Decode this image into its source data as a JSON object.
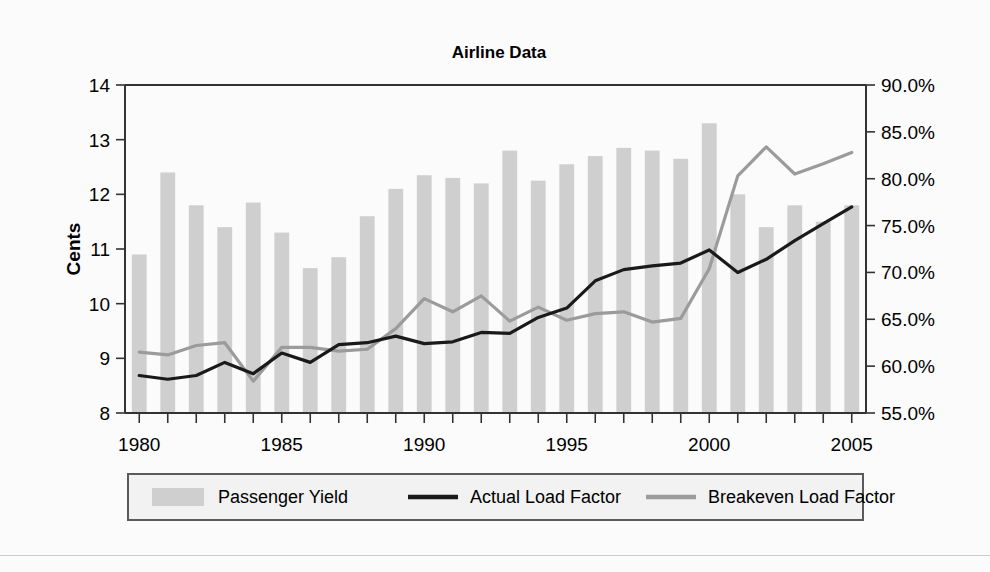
{
  "chart_data": {
    "type": "bar",
    "title": "Airline Data",
    "xlabel": "",
    "ylabel": "Cents",
    "y2label": "",
    "grid": false,
    "legend_position": "bottom",
    "x": [
      1980,
      1981,
      1982,
      1983,
      1984,
      1985,
      1986,
      1987,
      1988,
      1989,
      1990,
      1991,
      1992,
      1993,
      1994,
      1995,
      1996,
      1997,
      1998,
      1999,
      2000,
      2001,
      2002,
      2003,
      2004,
      2005
    ],
    "xtick_labels": [
      "1980",
      "1985",
      "1990",
      "1995",
      "2000",
      "2005"
    ],
    "xtick_values": [
      1980,
      1985,
      1990,
      1995,
      2000,
      2005
    ],
    "xlim": [
      1979.5,
      2005.5
    ],
    "ylim": [
      8,
      14
    ],
    "ytick_labels": [
      "8",
      "9",
      "10",
      "11",
      "12",
      "13",
      "14"
    ],
    "ytick_values": [
      8,
      9,
      10,
      11,
      12,
      13,
      14
    ],
    "y2lim": [
      55.0,
      90.0
    ],
    "y2tick_labels": [
      "55.0%",
      "60.0%",
      "65.0%",
      "70.0%",
      "75.0%",
      "80.0%",
      "85.0%",
      "90.0%"
    ],
    "y2tick_values": [
      55.0,
      60.0,
      65.0,
      70.0,
      75.0,
      80.0,
      85.0,
      90.0
    ],
    "series": [
      {
        "name": "Passenger Yield",
        "type": "bar",
        "axis": "left",
        "unit": "cents",
        "color": "#cfcfcf",
        "values": [
          10.9,
          12.4,
          11.8,
          11.4,
          11.85,
          11.3,
          10.65,
          10.85,
          11.6,
          12.1,
          12.35,
          12.3,
          12.2,
          12.8,
          12.25,
          12.55,
          12.7,
          12.85,
          12.8,
          12.65,
          13.3,
          12.0,
          11.4,
          11.8,
          11.5,
          11.8
        ]
      },
      {
        "name": "Actual Load Factor",
        "type": "line",
        "axis": "right",
        "unit": "percent",
        "color": "#1a1a1a",
        "values": [
          59.0,
          58.6,
          59.0,
          60.4,
          59.2,
          61.4,
          60.4,
          62.3,
          62.5,
          63.2,
          62.4,
          62.6,
          63.6,
          63.5,
          65.2,
          66.2,
          69.1,
          70.3,
          70.7,
          71.0,
          72.4,
          70.0,
          71.4,
          73.4,
          75.2,
          77.0
        ]
      },
      {
        "name": "Breakeven Load Factor",
        "type": "line",
        "axis": "right",
        "unit": "percent",
        "color": "#9b9b9b",
        "values": [
          61.5,
          61.2,
          62.2,
          62.5,
          58.4,
          62.0,
          62.0,
          61.6,
          61.8,
          64.0,
          67.2,
          65.8,
          67.5,
          64.8,
          66.3,
          64.9,
          65.6,
          65.8,
          64.7,
          65.1,
          70.4,
          80.3,
          83.4,
          80.5,
          81.6,
          82.8
        ]
      }
    ]
  },
  "legend": {
    "items": [
      {
        "label": "Passenger Yield",
        "marker": "swatch"
      },
      {
        "label": "Actual Load Factor",
        "marker": "line-dark"
      },
      {
        "label": "Breakeven Load Factor",
        "marker": "line-gray"
      }
    ]
  }
}
